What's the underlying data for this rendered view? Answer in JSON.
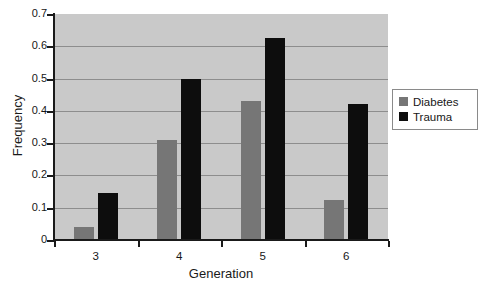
{
  "chart_data": {
    "type": "bar",
    "title": "",
    "xlabel": "Generation",
    "ylabel": "Frequency",
    "categories": [
      "3",
      "4",
      "5",
      "6"
    ],
    "series": [
      {
        "name": "Diabetes",
        "color": "#767676",
        "values": [
          0.04,
          0.31,
          0.43,
          0.125
        ]
      },
      {
        "name": "Trauma",
        "color": "#0d0d0d",
        "values": [
          0.145,
          0.5,
          0.625,
          0.42
        ]
      }
    ],
    "ylim": [
      0,
      0.7
    ],
    "yticks": [
      0,
      0.1,
      0.2,
      0.3,
      0.4,
      0.5,
      0.6,
      0.7
    ],
    "ytick_labels": [
      "0",
      "0.1",
      "0.2",
      "0.3",
      "0.4",
      "0.5",
      "0.6",
      "0.7"
    ],
    "grid": true,
    "legend_position": "right",
    "plot_background": "#c9c9c9",
    "figure_background": "#ffffff"
  },
  "legend": {
    "entries": [
      {
        "label": "Diabetes",
        "swatch": "diabetes"
      },
      {
        "label": "Trauma",
        "swatch": "trauma"
      }
    ]
  }
}
